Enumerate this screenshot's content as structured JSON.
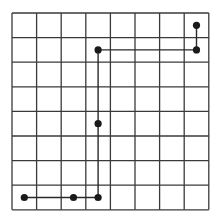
{
  "grid": {
    "columns": 8,
    "rows": 8,
    "origin_x": 12,
    "origin_y": 13,
    "cell_size": 24.6,
    "line_color": "#3a3a3a",
    "path_color": "#2a2a2a",
    "dot_color": "#1a1a1a"
  },
  "dots": [
    {
      "col": 7,
      "row": 0
    },
    {
      "col": 7,
      "row": 1
    },
    {
      "col": 3,
      "row": 1
    },
    {
      "col": 3,
      "row": 4
    },
    {
      "col": 3,
      "row": 7
    },
    {
      "col": 2,
      "row": 7
    },
    {
      "col": 0,
      "row": 7
    }
  ],
  "path": [
    {
      "col": 7,
      "row": 0
    },
    {
      "col": 7,
      "row": 1
    },
    {
      "col": 3,
      "row": 1
    },
    {
      "col": 3,
      "row": 7
    },
    {
      "col": 0,
      "row": 7
    }
  ]
}
